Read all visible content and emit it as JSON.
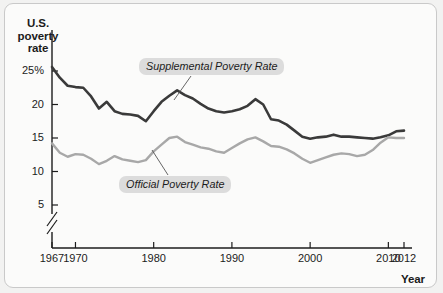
{
  "chart_data": {
    "type": "line",
    "title": "",
    "xlabel": "Year",
    "ylabel": "U.S. poverty rate",
    "xlim": [
      1967,
      2012
    ],
    "ylim": [
      4,
      26.5
    ],
    "grid": false,
    "legend_position": "inline-annotations",
    "axis_break": true,
    "axis_break_note": "y-axis broken between 0 and 5",
    "ytick_labels": [
      "25%",
      "20",
      "15",
      "10",
      "5"
    ],
    "ytick_values": [
      25,
      20,
      15,
      10,
      5
    ],
    "xtick_labels": [
      "1967",
      "1970",
      "1980",
      "1990",
      "2000",
      "2010",
      "2012"
    ],
    "xtick_values": [
      1967,
      1970,
      1980,
      1990,
      2000,
      2010,
      2012
    ],
    "x": [
      1967,
      1968,
      1969,
      1970,
      1971,
      1972,
      1973,
      1974,
      1975,
      1976,
      1977,
      1978,
      1979,
      1980,
      1981,
      1982,
      1983,
      1984,
      1985,
      1986,
      1987,
      1988,
      1989,
      1990,
      1991,
      1992,
      1993,
      1994,
      1995,
      1996,
      1997,
      1998,
      1999,
      2000,
      2001,
      2002,
      2003,
      2004,
      2005,
      2006,
      2007,
      2008,
      2009,
      2010,
      2011,
      2012
    ],
    "series": [
      {
        "name": "Supplemental Poverty Rate",
        "color": "#3a3a3a",
        "values": [
          25.6,
          24.0,
          22.8,
          22.6,
          22.5,
          21.2,
          19.4,
          20.4,
          19.0,
          18.6,
          18.5,
          18.3,
          17.5,
          19.0,
          20.4,
          21.3,
          22.1,
          21.4,
          20.9,
          20.1,
          19.4,
          19.0,
          18.8,
          19.0,
          19.3,
          19.8,
          20.8,
          20.0,
          17.8,
          17.6,
          17.0,
          16.1,
          15.2,
          14.9,
          15.1,
          15.2,
          15.5,
          15.2,
          15.2,
          15.1,
          15.0,
          14.9,
          15.1,
          15.4,
          16.0,
          16.1
        ]
      },
      {
        "name": "Official Poverty Rate",
        "color": "#a8a8a8",
        "values": [
          14.2,
          12.8,
          12.2,
          12.6,
          12.5,
          11.9,
          11.1,
          11.6,
          12.3,
          11.8,
          11.6,
          11.4,
          11.7,
          13.0,
          14.0,
          15.0,
          15.2,
          14.4,
          14.0,
          13.6,
          13.4,
          13.0,
          12.8,
          13.5,
          14.2,
          14.8,
          15.1,
          14.5,
          13.8,
          13.7,
          13.3,
          12.7,
          11.9,
          11.3,
          11.7,
          12.1,
          12.5,
          12.7,
          12.6,
          12.3,
          12.5,
          13.2,
          14.3,
          15.1,
          15.0,
          15.0
        ]
      }
    ]
  },
  "axes": {
    "y_title": "U.S. poverty rate",
    "x_title": "Year"
  },
  "annotations": {
    "supplemental_label": "Supplemental Poverty Rate",
    "official_label": "Official Poverty Rate"
  }
}
